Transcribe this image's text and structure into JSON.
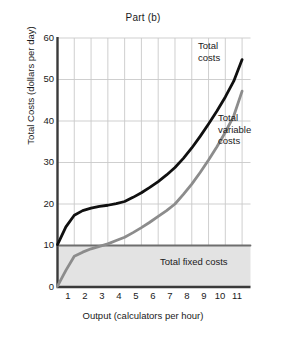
{
  "chart_data": {
    "type": "line",
    "title": "Part (b)",
    "xlabel": "Output (calculators per hour)",
    "ylabel": "Total Costs (dollars per day)",
    "xlim": [
      0,
      11.5
    ],
    "ylim": [
      0,
      60
    ],
    "xticks": [
      1,
      2,
      3,
      4,
      5,
      6,
      7,
      8,
      9,
      10,
      11
    ],
    "yticks": [
      0,
      10,
      20,
      30,
      40,
      50,
      60
    ],
    "grid": true,
    "legend_position": "inline-annotations",
    "series": [
      {
        "name": "Total costs",
        "color": "#101010",
        "x": [
          0,
          0.5,
          1,
          1.5,
          2,
          2.5,
          3,
          3.5,
          4,
          4.5,
          5,
          5.5,
          6,
          6.5,
          7,
          7.5,
          8,
          8.5,
          9,
          9.5,
          10,
          10.5,
          11
        ],
        "values": [
          10.2,
          14.5,
          17.3,
          18.4,
          19.0,
          19.4,
          19.7,
          20.1,
          20.6,
          21.6,
          22.7,
          24.0,
          25.4,
          27.0,
          28.8,
          31.0,
          33.5,
          36.3,
          39.3,
          42.4,
          45.8,
          49.6,
          54.8
        ]
      },
      {
        "name": "Total variable costs",
        "color": "#8c8c8c",
        "x": [
          0,
          0.5,
          1,
          1.5,
          2,
          2.5,
          3,
          3.5,
          4,
          4.5,
          5,
          5.5,
          6,
          6.5,
          7,
          7.5,
          8,
          8.5,
          9,
          9.5,
          10,
          10.5,
          11
        ],
        "values": [
          0.2,
          4.0,
          7.4,
          8.4,
          9.2,
          9.8,
          10.4,
          11.2,
          12.0,
          13.1,
          14.3,
          15.6,
          17.0,
          18.4,
          20.0,
          22.3,
          24.8,
          27.6,
          30.6,
          33.8,
          37.3,
          41.2,
          47.2
        ]
      },
      {
        "name": "Total fixed costs",
        "color": "#6e6e6e",
        "x": [
          0,
          11.5
        ],
        "values": [
          10,
          10
        ]
      }
    ],
    "annotations": [
      {
        "name": "total-costs-label",
        "text": "Total\ncosts",
        "line1": "Total",
        "line2": "costs"
      },
      {
        "name": "total-variable-costs-label",
        "text": "Total variable costs",
        "line1": "Total",
        "line2": "variable",
        "line3": "costs"
      },
      {
        "name": "total-fixed-costs-label",
        "text": "Total fixed costs"
      }
    ],
    "shaded_region": {
      "name": "total-fixed-costs-area",
      "from_y": 0,
      "to_y": 10,
      "color": "#e3e3e3"
    }
  },
  "labels": {
    "title": "Part (b)",
    "ylabel": "Total Costs (dollars per day)",
    "xlabel": "Output (calculators per hour)",
    "total_costs_l1": "Total",
    "total_costs_l2": "costs",
    "total_variable_l1": "Total",
    "total_variable_l2": "variable",
    "total_variable_l3": "costs",
    "total_fixed": "Total fixed costs"
  },
  "colors": {
    "total_costs": "#101010",
    "total_variable_costs": "#8c8c8c",
    "total_fixed_costs": "#6e6e6e",
    "fixed_area": "#e3e3e3",
    "grid": "#c9c9c9",
    "axis": "#3a3a3a",
    "text": "#1a1a1a"
  },
  "yticks": [
    "60",
    "50",
    "40",
    "30",
    "20",
    "10",
    "0"
  ],
  "xticks": [
    "1",
    "2",
    "3",
    "4",
    "5",
    "6",
    "7",
    "8",
    "9",
    "10",
    "11"
  ]
}
